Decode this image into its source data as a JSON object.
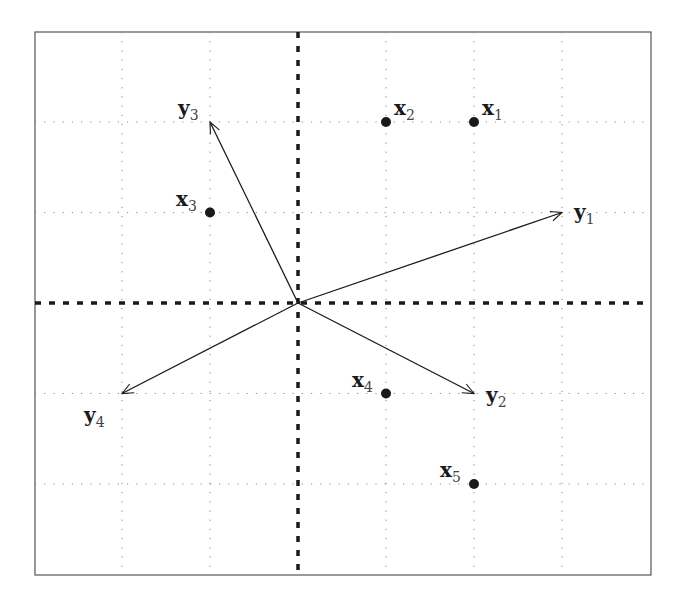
{
  "chart_data": {
    "type": "scatter",
    "title": "",
    "xlabel": "",
    "ylabel": "",
    "xlim": [
      -3,
      4
    ],
    "ylim": [
      -3,
      3
    ],
    "grid": true,
    "grid_style": "dotted",
    "axes_style": "dashed",
    "origin": [
      0,
      0
    ],
    "points": [
      {
        "name": "x1",
        "label_main": "x",
        "label_sub": "1",
        "x": 2,
        "y": 2
      },
      {
        "name": "x2",
        "label_main": "x",
        "label_sub": "2",
        "x": 1,
        "y": 2
      },
      {
        "name": "x3",
        "label_main": "x",
        "label_sub": "3",
        "x": -1,
        "y": 1
      },
      {
        "name": "x4",
        "label_main": "x",
        "label_sub": "4",
        "x": 1,
        "y": -1
      },
      {
        "name": "x5",
        "label_main": "x",
        "label_sub": "5",
        "x": 2,
        "y": -2
      }
    ],
    "vectors": [
      {
        "name": "y1",
        "label_main": "y",
        "label_sub": "1",
        "from": [
          0,
          0
        ],
        "to": [
          3,
          1
        ]
      },
      {
        "name": "y2",
        "label_main": "y",
        "label_sub": "2",
        "from": [
          0,
          0
        ],
        "to": [
          2,
          -1
        ]
      },
      {
        "name": "y3",
        "label_main": "y",
        "label_sub": "3",
        "from": [
          0,
          0
        ],
        "to": [
          -1,
          2
        ]
      },
      {
        "name": "y4",
        "label_main": "y",
        "label_sub": "4",
        "from": [
          0,
          0
        ],
        "to": [
          -2,
          -1
        ]
      }
    ]
  },
  "layout": {
    "frame": {
      "left": 35,
      "top": 32,
      "right": 651,
      "bottom": 575
    },
    "origin_px": [
      298,
      303
    ],
    "unit_x_px": 88,
    "unit_y_px": 90.5,
    "grid_x": [
      -2,
      -1,
      1,
      2,
      3
    ],
    "grid_y": [
      -2,
      -1,
      1,
      2
    ],
    "label_offsets": {
      "x1": [
        8,
        -7
      ],
      "x2": [
        8,
        -7
      ],
      "x3": [
        -34,
        -7
      ],
      "x4": [
        -34,
        -7
      ],
      "x5": [
        -34,
        -7
      ],
      "y1": [
        12,
        6
      ],
      "y2": [
        12,
        8
      ],
      "y3": [
        -32,
        -7
      ],
      "y4": [
        -38,
        28
      ]
    }
  },
  "colors": {
    "ink": "#1a1a1a",
    "grid": "#888888",
    "frame": "#555555",
    "background": "#ffffff"
  }
}
